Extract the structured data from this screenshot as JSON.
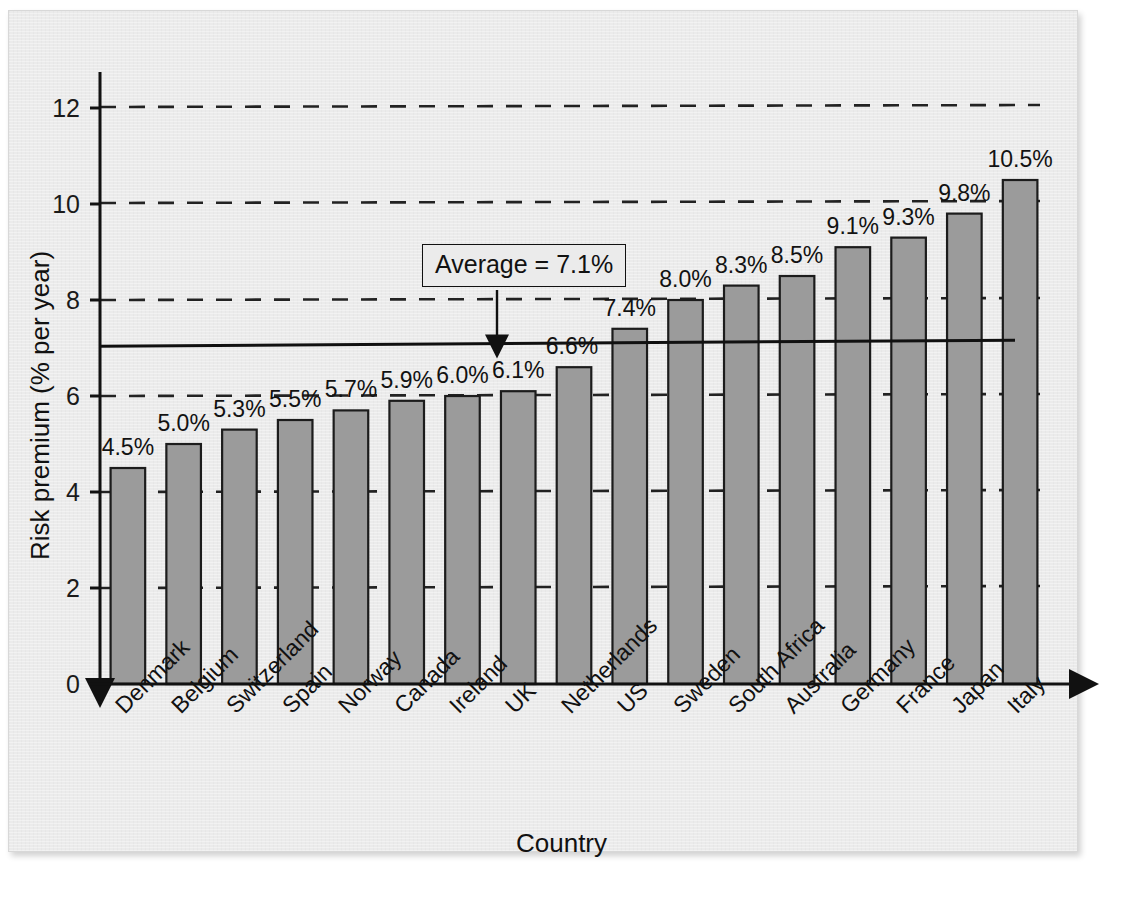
{
  "chart_data": {
    "type": "bar",
    "title": "",
    "xlabel": "Country",
    "ylabel": "Risk premium (% per year)",
    "ylim": [
      0,
      12.6
    ],
    "yticks": [
      0,
      2,
      4,
      6,
      8,
      10,
      12
    ],
    "ytick_labels": [
      "0",
      "2",
      "4",
      "6",
      "8",
      "10",
      "12"
    ],
    "grid": "dashed horizontal gridlines at 2,4,6,8,10,12",
    "legend": "none",
    "categories": [
      "Denmark",
      "Belgium",
      "Switzerland",
      "Spain",
      "Norway",
      "Canada",
      "Ireland",
      "UK",
      "Netherlands",
      "US",
      "Sweden",
      "South Africa",
      "Australia",
      "Germany",
      "France",
      "Japan",
      "Italy"
    ],
    "values": [
      4.5,
      5.0,
      5.3,
      5.5,
      5.7,
      5.9,
      6.0,
      6.1,
      6.6,
      7.4,
      8.0,
      8.3,
      8.5,
      9.1,
      9.3,
      9.8,
      10.5
    ],
    "value_labels": [
      "4.5%",
      "5.0%",
      "5.3%",
      "5.5%",
      "5.7%",
      "5.9%",
      "6.0%",
      "6.1%",
      "6.6%",
      "7.4%",
      "8.0%",
      "8.3%",
      "8.5%",
      "9.1%",
      "9.3%",
      "9.8%",
      "10.5%"
    ],
    "annotations": [
      {
        "name": "average-line",
        "label": "Average = 7.1%",
        "value": 7.1,
        "type": "hline-with-callout"
      }
    ],
    "colors": {
      "bar_fill": "#9b9b9b",
      "bar_border": "#1c1c1c",
      "axis": "#111111",
      "gridline": "#222222",
      "background": "#ebebeb"
    }
  }
}
